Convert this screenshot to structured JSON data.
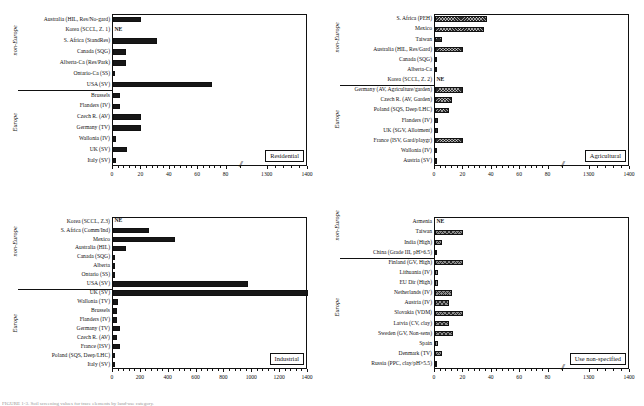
{
  "figure": {
    "caption_fragment": "FIGURE 1-3.  Soil screening values for trace elements by land-use category."
  },
  "axis": {
    "break_glyph": "//",
    "group_labels": {
      "non_europe": "non-Europe",
      "europe": "Europe"
    },
    "ne_marker": "NE"
  },
  "chart_data": [
    {
      "type": "bar",
      "title": "Residential",
      "orientation": "horizontal",
      "xlabel": "",
      "ylabel": "",
      "xlim": [
        0,
        1400
      ],
      "axis_break": {
        "from": 90,
        "to": 1250,
        "glyph": "//"
      },
      "ticks": [
        0,
        20,
        40,
        60,
        80,
        1300,
        1400
      ],
      "grid": false,
      "bar_style": "solid-black",
      "groups": [
        {
          "name": "non-Europe",
          "categories": [
            "Australia (HIL, Res/No-gard)",
            "Korea (SCCL, Z. 1)",
            "S. Africa (StandRes)",
            "Canada (SQG)",
            "Alberta-Ca (Res/Park)",
            "Ontario-Ca (SS)",
            "USA (SV)"
          ],
          "values": [
            20,
            null,
            31,
            9,
            9,
            1,
            70
          ],
          "not_evaluated": [
            "Korea (SCCL, Z. 1)"
          ]
        },
        {
          "name": "Europe",
          "categories": [
            "Brussels",
            "Flanders (IV)",
            "Czech R. (AV)",
            "Germany (TV)",
            "Wallonia (IV)",
            "UK (SV)",
            "Italy (SV)"
          ],
          "values": [
            5,
            5,
            20,
            20,
            2.5,
            10,
            2
          ],
          "not_evaluated": []
        }
      ]
    },
    {
      "type": "bar",
      "title": "Agricultural",
      "orientation": "horizontal",
      "xlabel": "",
      "ylabel": "",
      "xlim": [
        0,
        1400
      ],
      "axis_break": {
        "from": 90,
        "to": 1250,
        "glyph": "//"
      },
      "ticks": [
        0,
        20,
        40,
        60,
        80,
        1300,
        1400
      ],
      "grid": false,
      "bar_style": "dark-cross-hatch",
      "groups": [
        {
          "name": "non-Europe",
          "categories": [
            "S. Africa (PEH)",
            "Mexico",
            "Taiwan",
            "Australia (HIL, Res/Gard)",
            "Canada (SQG)",
            "Alberta-Ca",
            "Korea (SCCL, Z. 2)"
          ],
          "values": [
            37,
            35,
            5,
            20,
            1,
            1,
            null
          ],
          "not_evaluated": [
            "Korea (SCCL, Z. 2)"
          ]
        },
        {
          "name": "Europe",
          "categories": [
            "Germany (AV, Agriculture/garden)",
            "Czech R. (AV, Garden)",
            "Poland (SQS, Deep/LHC)",
            "Flanders (IV)",
            "UK (SGV, Allotment)",
            "France (ISV, Gard/playgr)",
            "Wallonia (IV)",
            "Austria (SV)"
          ],
          "values": [
            20,
            12,
            10,
            2,
            2,
            20,
            1,
            1
          ],
          "not_evaluated": []
        }
      ]
    },
    {
      "type": "bar",
      "title": "Industrial",
      "orientation": "horizontal",
      "xlabel": "",
      "ylabel": "",
      "xlim": [
        0,
        1400
      ],
      "axis_break": null,
      "ticks": [
        0,
        200,
        400,
        600,
        800,
        1000,
        1200,
        1400
      ],
      "grid": false,
      "bar_style": "solid-black",
      "groups": [
        {
          "name": "non-Europe",
          "categories": [
            "Korea (SCCL, Z.3)",
            "S. Africa (Comm/Ind)",
            "Mexico",
            "Australia (HIL)",
            "Canada (SQG)",
            "Alberta",
            "Ontario (SS)",
            "USA (SV)"
          ],
          "values": [
            null,
            260,
            450,
            95,
            8,
            8,
            5,
            970
          ],
          "not_evaluated": [
            "Korea (SCCL, Z.3)"
          ]
        },
        {
          "name": "Europe",
          "categories": [
            "UK (SV)",
            "Wallonia (TV)",
            "Brussels",
            "Flanders (IV)",
            "Germany (TV)",
            "Czech R. (AV)",
            "France (ISV)",
            "Poland (SQS, Deep/LHC)",
            "Italy (SV)"
          ],
          "values": [
            1400,
            40,
            30,
            30,
            55,
            30,
            50,
            10,
            10
          ],
          "not_evaluated": []
        }
      ]
    },
    {
      "type": "bar",
      "title": "Use non-specified",
      "orientation": "horizontal",
      "xlabel": "",
      "ylabel": "",
      "xlim": [
        0,
        1400
      ],
      "axis_break": {
        "from": 90,
        "to": 1250,
        "glyph": "//"
      },
      "ticks": [
        0,
        20,
        40,
        60,
        80,
        1300,
        1400
      ],
      "grid": false,
      "bar_style": "light-cross-hatch",
      "groups": [
        {
          "name": "non-Europe",
          "categories": [
            "Armenia",
            "Taiwan",
            "India (High)",
            "China (Grade III, pH>6.5)"
          ],
          "values": [
            null,
            20,
            5,
            1
          ],
          "not_evaluated": [
            "Armenia"
          ]
        },
        {
          "name": "Europe",
          "categories": [
            "Finland (GV, High)",
            "Lithuania (IV)",
            "EU Dir (High)",
            "Netherlands (IV)",
            "Austria (IV)",
            "Slovakia (VDM)",
            "Latvia (CV, clay)",
            "Sweden (GV, Non-sens)",
            "Spain",
            "Denmark (TV)",
            "Russia (PPC, clay/pH>5.5)"
          ],
          "values": [
            20,
            2.5,
            2,
            12,
            10,
            20,
            10,
            13,
            2,
            5,
            1.5
          ],
          "not_evaluated": []
        }
      ]
    }
  ]
}
